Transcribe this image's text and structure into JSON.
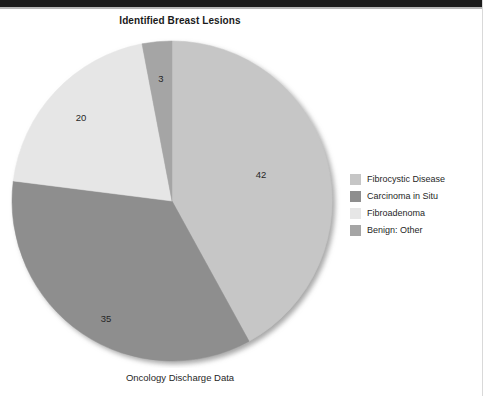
{
  "chart_data": {
    "type": "pie",
    "title": "Identified Breast Lesions",
    "caption": "Oncology Discharge Data",
    "categories": [
      "Fibrocystic Disease",
      "Carcinoma in Situ",
      "Fibroadenoma",
      "Benign: Other"
    ],
    "values": [
      42,
      35,
      20,
      3
    ],
    "labels": [
      "42",
      "35",
      "20",
      "3"
    ],
    "colors": [
      "#c6c6c6",
      "#8e8e8e",
      "#e6e6e6",
      "#a5a5a5"
    ],
    "total": 100,
    "start_angle_deg": 0,
    "direction": "clockwise",
    "legend_position": "right",
    "grid": false,
    "xlabel": "",
    "ylabel": "",
    "slices": [
      {
        "name": "Fibrocystic Disease",
        "value": 42,
        "label": "42",
        "color": "#c6c6c6",
        "start_deg": 0,
        "end_deg": 151.2,
        "label_x": 253,
        "label_y": 146
      },
      {
        "name": "Carcinoma in Situ",
        "value": 35,
        "label": "35",
        "color": "#8e8e8e",
        "start_deg": 151.2,
        "end_deg": 277.2,
        "label_x": 98,
        "label_y": 290
      },
      {
        "name": "Fibroadenoma",
        "value": 20,
        "label": "20",
        "color": "#e6e6e6",
        "start_deg": 277.2,
        "end_deg": 349.2,
        "label_x": 73,
        "label_y": 89
      },
      {
        "name": "Benign: Other",
        "value": 3,
        "label": "3",
        "color": "#a5a5a5",
        "start_deg": 349.2,
        "end_deg": 360,
        "label_x": 153,
        "label_y": 50
      }
    ],
    "geometry": {
      "cx": 164,
      "cy": 169,
      "r": 160
    }
  },
  "legend": {
    "items": [
      {
        "label": "Fibrocystic Disease",
        "color": "#c6c6c6"
      },
      {
        "label": "Carcinoma in Situ",
        "color": "#8e8e8e"
      },
      {
        "label": "Fibroadenoma",
        "color": "#e6e6e6"
      },
      {
        "label": "Benign: Other",
        "color": "#a5a5a5"
      }
    ]
  }
}
